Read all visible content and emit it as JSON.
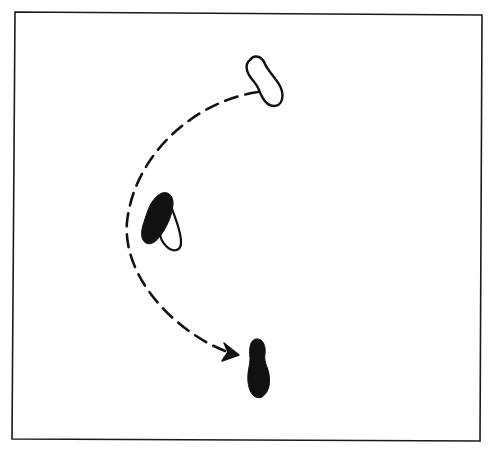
{
  "diagram": {
    "type": "footwork-step-diagram",
    "frame": {
      "stroke": "#1a1a1a",
      "background": "#ffffff"
    },
    "colors": {
      "ink": "#111111",
      "paper": "#ffffff"
    },
    "elements": [
      {
        "id": "start-foot",
        "kind": "footprint-outline",
        "description": "starting foot position (unweighted outline)"
      },
      {
        "id": "pivot-foot",
        "kind": "footprint-filled-with-outline",
        "description": "intermediate foot position, weighted ball with outlined heel"
      },
      {
        "id": "end-foot",
        "kind": "footprint-filled",
        "description": "final foot position (weighted, filled)"
      },
      {
        "id": "movement-path",
        "kind": "dashed-curved-arrow",
        "description": "curved dashed path from start position around to final position"
      }
    ]
  }
}
